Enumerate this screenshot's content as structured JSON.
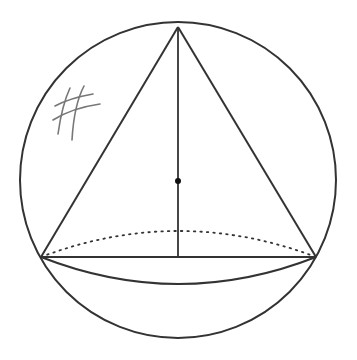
{
  "diagram": {
    "stroke_color": "#333333",
    "hatch_color": "#777777",
    "sphere": {
      "cx": 178,
      "cy": 180,
      "r": 158
    },
    "cone": {
      "apex": {
        "x": 178,
        "y": 27
      },
      "base_left": {
        "x": 41,
        "y": 257
      },
      "base_right": {
        "x": 316,
        "y": 257
      },
      "base_front_arc_depth": 27,
      "base_back_arc_depth": 26
    },
    "center_point": {
      "x": 178,
      "y": 181,
      "r": 3
    },
    "axis": {
      "x": 178,
      "y1": 27,
      "y2": 257
    }
  }
}
